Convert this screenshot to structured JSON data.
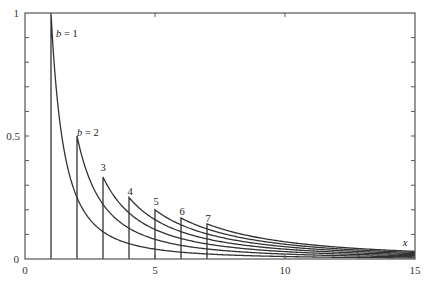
{
  "chart_data": {
    "type": "line",
    "title": "",
    "xlabel": "x",
    "ylabel": "",
    "xlim": [
      0,
      15
    ],
    "ylim": [
      0,
      1
    ],
    "grid": false,
    "legend": "none (inline curve labels)",
    "function": "f(x) = b / x^2 for x >= b, vertical drop at x = b",
    "x_ticks": [
      0,
      5,
      10,
      15
    ],
    "x_tick_labels": [
      "0",
      "5",
      "10",
      "15"
    ],
    "x_minor_ticks": [
      1,
      2,
      3,
      4,
      6,
      7
    ],
    "y_ticks": [
      0,
      0.5,
      1
    ],
    "y_tick_labels": [
      "0",
      "0.5",
      "1"
    ],
    "y_minor_step": 0.1,
    "series": [
      {
        "name": "b = 1",
        "label": "b = 1",
        "b": 1,
        "start_x": 1,
        "peak_y": 1.0
      },
      {
        "name": "b = 2",
        "label": "b = 2",
        "b": 2,
        "start_x": 2,
        "peak_y": 0.5
      },
      {
        "name": "3",
        "label": "3",
        "b": 3,
        "start_x": 3,
        "peak_y": 0.333
      },
      {
        "name": "4",
        "label": "4",
        "b": 4,
        "start_x": 4,
        "peak_y": 0.25
      },
      {
        "name": "5",
        "label": "5",
        "b": 5,
        "start_x": 5,
        "peak_y": 0.2
      },
      {
        "name": "6",
        "label": "6",
        "b": 6,
        "start_x": 6,
        "peak_y": 0.167
      },
      {
        "name": "7",
        "label": "7",
        "b": 7,
        "start_x": 7,
        "peak_y": 0.143
      }
    ],
    "annotations": [
      {
        "text": "b = 1",
        "x": 1.2,
        "y": 0.93
      },
      {
        "text": "b = 2",
        "x": 2.0,
        "y": 0.54
      },
      {
        "text": "3",
        "x": 3.0,
        "y": 0.37
      },
      {
        "text": "4",
        "x": 4.0,
        "y": 0.28
      },
      {
        "text": "5",
        "x": 5.0,
        "y": 0.23
      },
      {
        "text": "6",
        "x": 6.0,
        "y": 0.2
      },
      {
        "text": "7",
        "x": 7.0,
        "y": 0.17
      },
      {
        "text": "x",
        "x": 14.8,
        "y": 0.06
      }
    ]
  },
  "axes": {
    "x_label": "x",
    "tick_labels": {
      "x0": "0",
      "x5": "5",
      "x10": "10",
      "x15": "15",
      "y0": "0",
      "y05": "0.5",
      "y1": "1"
    }
  },
  "colors": {
    "line": "#333333",
    "axis": "#555555",
    "background": "#ffffff"
  }
}
